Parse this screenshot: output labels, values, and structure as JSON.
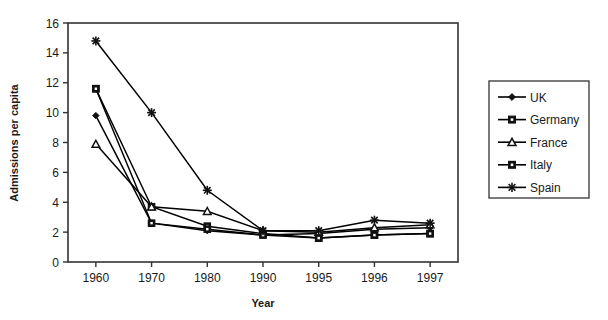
{
  "chart_data": {
    "type": "line",
    "title": "",
    "xlabel": "Year",
    "ylabel": "Admissions per capita",
    "categories": [
      "1960",
      "1970",
      "1980",
      "1990",
      "1995",
      "1996",
      "1997"
    ],
    "x": [
      1960,
      1970,
      1980,
      1990,
      1995,
      1996,
      1997
    ],
    "ylim": [
      0,
      16
    ],
    "yticks": [
      0,
      2,
      4,
      6,
      8,
      10,
      12,
      14,
      16
    ],
    "ytick_labels": [
      "0",
      "2",
      "4",
      "6",
      "8",
      "10",
      "12",
      "14",
      "16"
    ],
    "grid": false,
    "legend_position": "right",
    "series": [
      {
        "name": "UK",
        "marker": "diamond",
        "color": "#000000",
        "values": [
          9.8,
          2.6,
          2.1,
          1.8,
          1.9,
          2.2,
          2.3
        ]
      },
      {
        "name": "Germany",
        "marker": "square",
        "color": "#000000",
        "values": [
          11.6,
          3.7,
          2.4,
          1.9,
          1.6,
          1.8,
          1.9
        ]
      },
      {
        "name": "France",
        "marker": "triangle",
        "color": "#000000",
        "values": [
          7.9,
          3.7,
          3.4,
          2.1,
          2.0,
          2.3,
          2.5
        ]
      },
      {
        "name": "Italy",
        "marker": "square",
        "color": "#000000",
        "values": [
          11.6,
          2.6,
          2.2,
          1.8,
          1.6,
          1.8,
          1.9
        ]
      },
      {
        "name": "Spain",
        "marker": "star",
        "color": "#000000",
        "values": [
          14.8,
          10.0,
          4.8,
          2.1,
          2.1,
          2.8,
          2.6
        ]
      }
    ]
  },
  "legend": {
    "items": [
      {
        "label": "UK"
      },
      {
        "label": "Germany"
      },
      {
        "label": "France"
      },
      {
        "label": "Italy"
      },
      {
        "label": "Spain"
      }
    ]
  }
}
